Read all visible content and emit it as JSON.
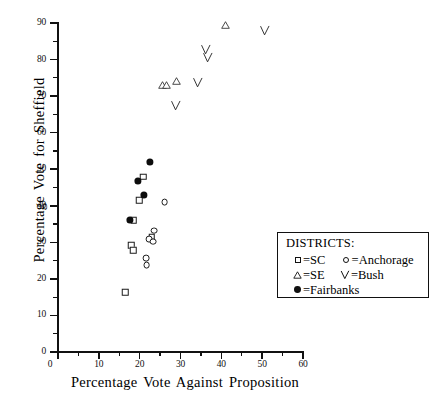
{
  "chart_data": {
    "type": "scatter",
    "title": "",
    "xlabel": "Percentage Vote Against Proposition",
    "ylabel": "Percentage Vote for Sheffield",
    "xlim": [
      0,
      60
    ],
    "ylim": [
      0,
      90
    ],
    "xticks": [
      0,
      10,
      20,
      30,
      40,
      50,
      60
    ],
    "yticks": [
      0,
      10,
      20,
      30,
      40,
      50,
      60,
      70,
      80,
      90
    ],
    "xtick_minor_step": 5,
    "grid": false,
    "legend_position": "lower-right",
    "legend_title": "DISTRICTS:",
    "series": [
      {
        "name": "SC",
        "marker": "open-square",
        "points": [
          [
            20.9,
            48.0
          ],
          [
            23.0,
            31.5
          ],
          [
            19.9,
            41.5
          ],
          [
            18.6,
            36.0
          ],
          [
            17.9,
            29.2
          ],
          [
            18.4,
            27.9
          ],
          [
            16.5,
            16.3
          ]
        ]
      },
      {
        "name": "Anchorage",
        "marker": "open-circle",
        "points": [
          [
            26.1,
            41.0
          ],
          [
            23.6,
            33.2
          ],
          [
            22.4,
            30.9
          ],
          [
            23.3,
            30.2
          ],
          [
            21.6,
            25.6
          ],
          [
            21.7,
            23.7
          ]
        ]
      },
      {
        "name": "SE",
        "marker": "open-triangle",
        "points": [
          [
            25.6,
            73.0
          ],
          [
            26.6,
            73.0
          ],
          [
            29.1,
            74.2
          ],
          [
            40.9,
            89.5
          ]
        ]
      },
      {
        "name": "Bush",
        "marker": "check",
        "points": [
          [
            29.5,
            66.5
          ],
          [
            35.0,
            73.0
          ],
          [
            36.9,
            82.0
          ],
          [
            37.4,
            79.8
          ],
          [
            51.2,
            87.0
          ]
        ]
      },
      {
        "name": "Fairbanks",
        "marker": "filled-circle",
        "points": [
          [
            22.6,
            52.0
          ],
          [
            19.6,
            46.7
          ],
          [
            21.1,
            43.0
          ],
          [
            17.6,
            36.2
          ]
        ]
      }
    ]
  },
  "axes": {
    "x_title": "Percentage Vote Against Proposition",
    "y_title": "Percentage Vote for Sheffield",
    "x_labels": [
      "0",
      "10",
      "20",
      "30",
      "40",
      "50",
      "60"
    ],
    "y_labels": [
      "0",
      "10",
      "20",
      "30",
      "40",
      "50",
      "60",
      "70",
      "80",
      "90"
    ]
  },
  "legend": {
    "title": "DISTRICTS:",
    "entries": [
      {
        "symbol": "open-square",
        "eq": "=",
        "label": "SC"
      },
      {
        "symbol": "open-circle",
        "eq": "=",
        "label": "Anchorage"
      },
      {
        "symbol": "open-triangle",
        "eq": "=",
        "label": "SE"
      },
      {
        "symbol": "check",
        "eq": "=",
        "label": "Bush"
      },
      {
        "symbol": "filled-circle",
        "eq": "=",
        "label": "Fairbanks"
      }
    ]
  },
  "style": {
    "axis_color": "#111111",
    "marker_color": "#1b1b1b",
    "background": "#ffffff"
  }
}
